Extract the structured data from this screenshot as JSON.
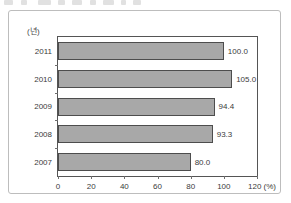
{
  "chart_data": {
    "type": "bar",
    "orientation": "horizontal",
    "title": "",
    "xlabel": "(%)",
    "ylabel": "(년)",
    "categories": [
      "2011",
      "2010",
      "2009",
      "2008",
      "2007"
    ],
    "values": [
      100.0,
      105.0,
      94.4,
      93.3,
      80.0
    ],
    "value_labels": [
      "100.0",
      "105.0",
      "94.4",
      "93.3",
      "80.0"
    ],
    "xlim": [
      0,
      120
    ],
    "xticks": [
      0,
      20,
      40,
      60,
      80,
      100,
      120
    ],
    "xtick_labels": [
      "0",
      "20",
      "40",
      "60",
      "80",
      "100",
      "120"
    ],
    "x_unit_label": "(%)",
    "grid": false,
    "legend": null,
    "bar_fill_color": "#a8a8a8",
    "bar_border_color": "#4d4d4d",
    "axis_color": "#555555",
    "text_color": "#3b3b3b"
  }
}
